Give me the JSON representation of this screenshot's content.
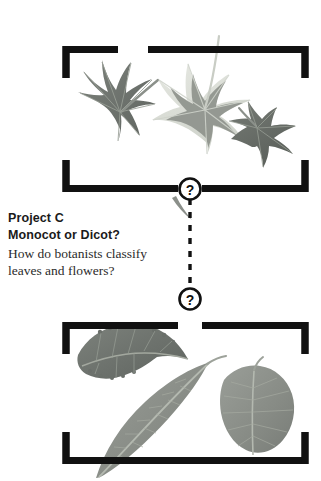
{
  "page": {
    "background": "#ffffff",
    "width": 321,
    "height": 481
  },
  "colors": {
    "bracket": "#111111",
    "text_heading": "#1a1a1a",
    "text_body": "#2b2b2b",
    "leaf_dark": "#6f7470",
    "leaf_mid": "#8d918c",
    "leaf_pale": "#d9dcd6",
    "vein": "#b9bdb6",
    "badge_fill": "#ffffff",
    "badge_stroke": "#111111"
  },
  "text": {
    "project_label": "Project C",
    "question_title": "Monocot or Dicot?",
    "description_line1": "How do botanists classify",
    "description_line2": "leaves and flowers?"
  },
  "groups": [
    {
      "id": "top-group",
      "name": "dicot-palmate-leaves-group",
      "badge": "?",
      "specimens": [
        {
          "name": "sweetgum-palmate-leaf",
          "shape": "palmate-7-lobe",
          "tone": "dark"
        },
        {
          "name": "variegated-ivy-leaf",
          "shape": "palmate-5-lobe",
          "tone": "pale"
        },
        {
          "name": "small-maple-leaf",
          "shape": "palmate-3-lobe",
          "tone": "dark"
        }
      ]
    },
    {
      "id": "bottom-group",
      "name": "simple-entire-leaves-group",
      "badge": "?",
      "specimens": [
        {
          "name": "serrated-ovate-leaf",
          "shape": "ovate-serrate",
          "tone": "dark"
        },
        {
          "name": "lanceolate-willow-leaf",
          "shape": "lanceolate",
          "tone": "mid"
        },
        {
          "name": "rounded-ovate-leaf",
          "shape": "ovate",
          "tone": "mid"
        }
      ]
    }
  ],
  "connector": {
    "name": "dashed-connector",
    "style": "dashed",
    "from_badge": "?",
    "to_badge": "?"
  },
  "badges": {
    "top_symbol": "?",
    "bottom_symbol": "?"
  }
}
